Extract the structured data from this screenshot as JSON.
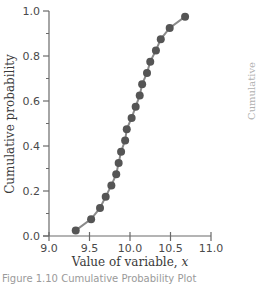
{
  "chart_data": {
    "type": "line",
    "title": "",
    "xlabel": "Value of variable, x",
    "ylabel": "Cumulative probability",
    "xlim": [
      9.0,
      11.0
    ],
    "ylim": [
      0.0,
      1.0
    ],
    "xticks": [
      "9.0",
      "9.5",
      "10.0",
      "10.5",
      "11.0"
    ],
    "yticks": [
      "0.0",
      "0.2",
      "0.4",
      "0.6",
      "0.8",
      "1.0"
    ],
    "grid": false,
    "legend": null,
    "markers": "filled circles connected by line",
    "series": [
      {
        "name": "Cumulative probability",
        "x": [
          9.33,
          9.52,
          9.63,
          9.7,
          9.77,
          9.83,
          9.86,
          9.89,
          9.94,
          9.96,
          10.02,
          10.07,
          10.12,
          10.15,
          10.21,
          10.25,
          10.32,
          10.38,
          10.49,
          10.68
        ],
        "y": [
          0.025,
          0.075,
          0.125,
          0.175,
          0.225,
          0.275,
          0.325,
          0.375,
          0.425,
          0.475,
          0.525,
          0.575,
          0.625,
          0.675,
          0.725,
          0.775,
          0.825,
          0.875,
          0.925,
          0.975
        ]
      }
    ]
  },
  "colors": {
    "axis": "#6a6a6a",
    "line": "#8a8a8a",
    "marker": "#555555"
  },
  "caption": "Figure 1.10 Cumulative Probability Plot",
  "edge_label": "Cumulative probability"
}
